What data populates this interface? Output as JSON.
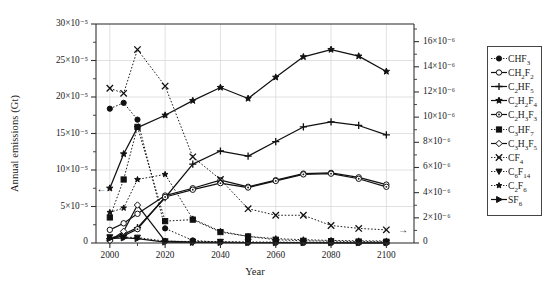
{
  "chart_data": {
    "type": "line",
    "title": "",
    "xlabel": "Year",
    "ylabel_left": "Annual emissions (Gt)",
    "ylabel_right": "Annual emissions (Gt)",
    "x": [
      2000,
      2005,
      2010,
      2020,
      2030,
      2040,
      2050,
      2060,
      2070,
      2080,
      2090,
      2100
    ],
    "xlim": [
      1995,
      2110
    ],
    "xticks": [
      2000,
      2020,
      2040,
      2060,
      2080,
      2100
    ],
    "xticklabels": [
      "2000",
      "2020",
      "2040",
      "2060",
      "2080",
      "2100"
    ],
    "ylim_left": [
      0,
      0.0003
    ],
    "yticks_left": [
      0,
      5e-05,
      0.0001,
      0.00015,
      0.0002,
      0.00025,
      0.0003
    ],
    "yticklabels_left": [
      "0",
      "5×10⁻⁵",
      "10×10⁻⁵",
      "15×10⁻⁵",
      "20×10⁻⁵",
      "25×10⁻⁵",
      "30×10⁻⁵"
    ],
    "ylim_right": [
      0,
      1.74e-05
    ],
    "yticks_right": [
      0,
      2e-06,
      4e-06,
      6e-06,
      8e-06,
      1e-05,
      1.2e-05,
      1.4e-05,
      1.6e-05
    ],
    "yticklabels_right": [
      "0",
      "2×10⁻⁶",
      "4×10⁻⁶",
      "6×10⁻⁶",
      "8×10⁻⁶",
      "10×10⁻⁶",
      "12×10⁻⁶",
      "14×10⁻⁶",
      "16×10⁻⁶"
    ],
    "grid": true,
    "legend_position": "right-outside",
    "units_left": "1e-5",
    "series": [
      {
        "name": "CHF3",
        "label_html": "CHF<sub>3</sub>",
        "marker": "filled-circle",
        "linestyle": "dotted",
        "axis": "left",
        "values_e5": [
          18.4,
          19.2,
          16.9,
          2.0,
          0.35,
          0.12,
          0.06,
          0.04,
          0.03,
          0.02,
          0.02,
          0.02
        ]
      },
      {
        "name": "CH2F2",
        "label_html": "CH<sub>2</sub>F<sub>2</sub>",
        "marker": "open-circle",
        "linestyle": "solid",
        "axis": "left",
        "values_e5": [
          1.8,
          2.7,
          4.0,
          6.5,
          7.5,
          8.6,
          7.7,
          8.6,
          9.5,
          9.6,
          9.0,
          8.0
        ]
      },
      {
        "name": "C2HF5",
        "label_html": "C<sub>2</sub>HF<sub>5</sub>",
        "marker": "plus",
        "linestyle": "solid",
        "axis": "left",
        "values_e5": [
          0.6,
          1.2,
          2.1,
          6.2,
          10.8,
          12.6,
          11.9,
          13.9,
          15.9,
          16.6,
          16.1,
          14.8
        ]
      },
      {
        "name": "C2H2F4",
        "label_html": "C<sub>2</sub>H<sub>2</sub>F<sub>4</sub>",
        "marker": "filled-star",
        "linestyle": "solid",
        "axis": "left",
        "values_e5": [
          7.5,
          12.2,
          15.8,
          17.5,
          19.5,
          21.3,
          19.8,
          22.7,
          25.5,
          26.5,
          25.6,
          23.5
        ]
      },
      {
        "name": "C2H3F3",
        "label_html": "C<sub>2</sub>H<sub>3</sub>F<sub>3</sub>",
        "marker": "open-circle-dot",
        "linestyle": "solid",
        "axis": "left",
        "values_e5": [
          0.55,
          1.0,
          1.9,
          6.3,
          7.3,
          8.2,
          7.6,
          8.5,
          9.4,
          9.5,
          8.8,
          7.7
        ]
      },
      {
        "name": "C3HF7",
        "label_html": "C<sub>3</sub>HF<sub>7</sub>",
        "marker": "filled-square",
        "linestyle": "dotted",
        "axis": "left",
        "values_e5": [
          3.5,
          8.7,
          15.9,
          3.0,
          3.2,
          1.5,
          0.9,
          0.45,
          0.3,
          0.25,
          0.2,
          0.18
        ]
      },
      {
        "name": "C3H3F5",
        "label_html": "C<sub>3</sub>H<sub>3</sub>F<sub>5</sub>",
        "marker": "open-diamond",
        "linestyle": "solid",
        "axis": "left",
        "values_e5": [
          0.3,
          1.6,
          5.2,
          0.25,
          0.12,
          0.08,
          0.06,
          0.05,
          0.04,
          0.04,
          0.03,
          0.03
        ]
      },
      {
        "name": "CF4",
        "label_html": "CF<sub>4</sub>",
        "marker": "x-cross",
        "linestyle": "dotted",
        "axis": "left",
        "values_e5": [
          21.2,
          20.5,
          26.5,
          21.5,
          11.8,
          8.7,
          4.7,
          3.8,
          3.8,
          2.4,
          2.0,
          1.8
        ]
      },
      {
        "name": "C6F14",
        "label_html": "C<sub>6</sub>F<sub>14</sub>",
        "marker": "down-triangle",
        "linestyle": "dotted",
        "axis": "left",
        "values_e5": [
          0.8,
          0.8,
          0.75,
          0.25,
          0.2,
          0.18,
          0.15,
          0.12,
          0.1,
          0.08,
          0.07,
          0.06
        ]
      },
      {
        "name": "C2F6",
        "label_html": "C<sub>2</sub>F<sub>6</sub>",
        "marker": "filled-star-small",
        "linestyle": "dotted",
        "axis": "left",
        "values_e5": [
          4.2,
          4.8,
          8.7,
          9.4,
          3.3,
          1.6,
          0.9,
          0.6,
          0.45,
          0.35,
          0.3,
          0.28
        ]
      },
      {
        "name": "SF6",
        "label_html": "SF<sub>6</sub>",
        "marker": "right-triangle",
        "linestyle": "solid",
        "axis": "left",
        "values_e5": [
          0.6,
          0.7,
          0.6,
          0.12,
          0.08,
          0.06,
          0.05,
          0.04,
          0.04,
          0.03,
          0.03,
          0.03
        ]
      }
    ],
    "annotations": [
      {
        "type": "left-arrow",
        "text": "←",
        "near": "C2H2F4-start",
        "x": 1997,
        "y_e5": 7.5
      },
      {
        "type": "right-arrow",
        "text": "→",
        "near": "CF4-end",
        "x": 2106,
        "y_e5": 1.8
      }
    ]
  },
  "legend": {
    "items": [
      {
        "label": "CHF3",
        "marker": "filled-circle"
      },
      {
        "label": "CH2F2",
        "marker": "open-circle"
      },
      {
        "label": "C2HF5",
        "marker": "plus"
      },
      {
        "label": "C2H2F4",
        "marker": "filled-star"
      },
      {
        "label": "C2H3F3",
        "marker": "open-circle-dot"
      },
      {
        "label": "C3HF7",
        "marker": "filled-square"
      },
      {
        "label": "C3H3F5",
        "marker": "open-diamond"
      },
      {
        "label": "CF4",
        "marker": "x-cross"
      },
      {
        "label": "C6F14",
        "marker": "down-triangle"
      },
      {
        "label": "C2F6",
        "marker": "filled-star-small"
      },
      {
        "label": "SF6",
        "marker": "right-triangle"
      }
    ]
  },
  "colors": {
    "line": "#111111",
    "grid": "#d9d9d9",
    "axis": "#333333",
    "background": "#ffffff"
  }
}
